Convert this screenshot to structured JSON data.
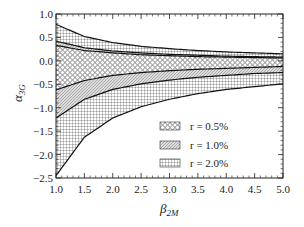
{
  "chart_data": {
    "type": "area",
    "title": "",
    "xlabel": "β_2M",
    "ylabel": "α_3G",
    "xlim": [
      1.0,
      5.0
    ],
    "ylim": [
      -2.5,
      1.0
    ],
    "xticks": [
      "1.0",
      "1.5",
      "2.0",
      "2.5",
      "3.0",
      "3.5",
      "4.0",
      "4.5",
      "5.0"
    ],
    "yticks": [
      "1.0",
      "0.5",
      "0.0",
      "−0.5",
      "−1.0",
      "−1.5",
      "−2.0",
      "−2.5"
    ],
    "grid": false,
    "legend_position": "lower right",
    "x": [
      1.0,
      1.5,
      2.0,
      2.5,
      3.0,
      3.5,
      4.0,
      4.5,
      5.0
    ],
    "series": [
      {
        "name": "r = 0.5%",
        "pattern": "circles",
        "upper": [
          0.33,
          0.22,
          0.17,
          0.13,
          0.11,
          0.09,
          0.08,
          0.07,
          0.06
        ],
        "lower": [
          -0.62,
          -0.42,
          -0.31,
          -0.25,
          -0.21,
          -0.18,
          -0.16,
          -0.14,
          -0.12
        ]
      },
      {
        "name": "r = 1.0%",
        "pattern": "diagonal-dots",
        "upper": [
          0.42,
          0.28,
          0.21,
          0.17,
          0.14,
          0.12,
          0.1,
          0.09,
          0.08
        ],
        "lower": [
          -1.22,
          -0.82,
          -0.61,
          -0.49,
          -0.41,
          -0.35,
          -0.31,
          -0.27,
          -0.25
        ]
      },
      {
        "name": "r = 2.0%",
        "pattern": "vertical-grid",
        "upper": [
          0.78,
          0.52,
          0.39,
          0.31,
          0.26,
          0.22,
          0.19,
          0.17,
          0.15
        ],
        "lower": [
          -2.45,
          -1.63,
          -1.22,
          -0.98,
          -0.82,
          -0.7,
          -0.61,
          -0.55,
          -0.49
        ]
      }
    ]
  },
  "legend": {
    "items": [
      {
        "label": "r = 0.5%"
      },
      {
        "label": "r = 1.0%"
      },
      {
        "label": "r = 2.0%"
      }
    ]
  },
  "axes": {
    "xlabel_main": "β",
    "xlabel_sub": "2M",
    "ylabel_main": "α",
    "ylabel_sub": "3G"
  }
}
